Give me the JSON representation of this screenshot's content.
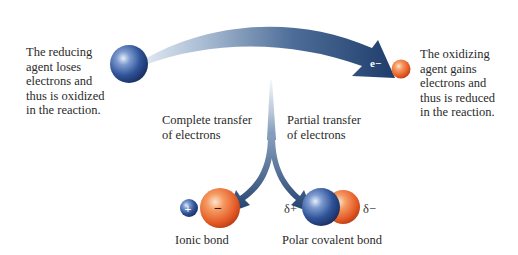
{
  "left_note": {
    "lines": [
      "The reducing",
      "agent loses",
      "electrons and",
      "thus is oxidized",
      "in the reaction."
    ]
  },
  "right_note": {
    "lines": [
      "The oxidizing",
      "agent gains",
      "electrons and",
      "thus is reduced",
      "in the reaction."
    ]
  },
  "electron_label": "e−",
  "branches": {
    "left": {
      "lines": [
        "Complete transfer",
        "of electrons"
      ]
    },
    "right": {
      "lines": [
        "Partial transfer",
        "of electrons"
      ]
    }
  },
  "ionic": {
    "label": "Ionic bond",
    "cation_sign": "+",
    "anion_sign": "−"
  },
  "polar": {
    "label": "Polar covalent bond",
    "delta_plus": "δ+",
    "delta_minus": "δ−"
  },
  "colors": {
    "arrow_dark": "#1f3d6b",
    "arrow_light": "#c9d6e6",
    "blue_sphere": "#2c4f8f",
    "orange_sphere": "#e8602c"
  }
}
